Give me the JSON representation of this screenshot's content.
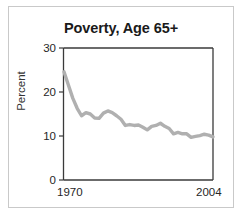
{
  "figure": {
    "title": "Poverty, Age 65+",
    "border_color": "#c9c9c9",
    "background": "#ffffff"
  },
  "axes": {
    "ylabel": "Percent",
    "xlabel": "",
    "y_ticks": [
      "0",
      "10",
      "20",
      "30"
    ],
    "x_ticks": [
      "1970",
      "2004"
    ],
    "axis_color": "#3a3a3a"
  },
  "chart_data": {
    "type": "line",
    "title": "Poverty, Age 65+",
    "xlabel": "",
    "ylabel": "Percent",
    "xlim": [
      1970,
      2004
    ],
    "ylim": [
      0,
      30
    ],
    "y_ticks": [
      0,
      10,
      20,
      30
    ],
    "x_ticks": [
      1970,
      2004
    ],
    "grid": false,
    "legend": false,
    "line_color": "#b0b0b0",
    "series": [
      {
        "name": "Poverty rate, age 65+",
        "x": [
          1970,
          1971,
          1972,
          1973,
          1974,
          1975,
          1976,
          1977,
          1978,
          1979,
          1980,
          1981,
          1982,
          1983,
          1984,
          1985,
          1986,
          1987,
          1988,
          1989,
          1990,
          1991,
          1992,
          1993,
          1994,
          1995,
          1996,
          1997,
          1998,
          1999,
          2000,
          2001,
          2002,
          2003,
          2004
        ],
        "values": [
          24.6,
          21.6,
          18.6,
          16.3,
          14.6,
          15.3,
          15.0,
          14.1,
          14.0,
          15.2,
          15.7,
          15.3,
          14.6,
          13.8,
          12.4,
          12.6,
          12.4,
          12.5,
          12.0,
          11.4,
          12.2,
          12.4,
          12.9,
          12.2,
          11.7,
          10.5,
          10.8,
          10.5,
          10.5,
          9.7,
          9.9,
          10.1,
          10.4,
          10.2,
          9.8
        ]
      }
    ]
  }
}
